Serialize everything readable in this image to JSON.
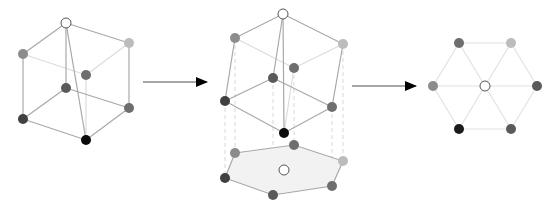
{
  "diagram": {
    "colors": {
      "edge": "#a8a8a8",
      "edge_back": "#dcdcdc",
      "projection_line": "#d8d8d8",
      "hex_fill": "#f2f2f2",
      "arrow": "#000000",
      "arrow_line": "#8a8a8a",
      "node_white": "#ffffff",
      "node_light": "#bcbcbc",
      "node_gray": "#8c8c8c",
      "node_mid": "#6e6e6e",
      "node_dark": "#404040",
      "node_black": "#0a0a0a"
    },
    "panels": [
      {
        "name": "cube-original",
        "nodes": [
          {
            "id": "top",
            "x": 66,
            "y": 23,
            "shade": "node_white"
          },
          {
            "id": "upper-left",
            "x": 23,
            "y": 54,
            "shade": "node_gray"
          },
          {
            "id": "upper-right",
            "x": 129,
            "y": 43,
            "shade": "node_light"
          },
          {
            "id": "back",
            "x": 86,
            "y": 75,
            "shade": "node_mid"
          },
          {
            "id": "inner",
            "x": 66,
            "y": 88,
            "shade": "node_mid"
          },
          {
            "id": "lower-left",
            "x": 23,
            "y": 119,
            "shade": "node_dark"
          },
          {
            "id": "lower-right",
            "x": 129,
            "y": 108,
            "shade": "node_mid"
          },
          {
            "id": "bottom",
            "x": 86,
            "y": 140,
            "shade": "node_black"
          }
        ]
      },
      {
        "name": "cube-rotated",
        "nodes": [
          {
            "id": "top",
            "x": 283,
            "y": 14,
            "shade": "node_white"
          },
          {
            "id": "upper-left",
            "x": 235,
            "y": 38,
            "shade": "node_gray"
          },
          {
            "id": "upper-right",
            "x": 343,
            "y": 44,
            "shade": "node_light"
          },
          {
            "id": "back",
            "x": 294,
            "y": 68,
            "shade": "node_mid"
          },
          {
            "id": "inner",
            "x": 273,
            "y": 78,
            "shade": "node_mid"
          },
          {
            "id": "lower-left",
            "x": 225,
            "y": 101,
            "shade": "node_dark"
          },
          {
            "id": "lower-right",
            "x": 332,
            "y": 107,
            "shade": "node_mid"
          },
          {
            "id": "bottom",
            "x": 284,
            "y": 133,
            "shade": "node_black"
          }
        ]
      },
      {
        "name": "projection-hexagon",
        "nodes": [
          {
            "id": "upper-left",
            "x": 235,
            "y": 153,
            "shade": "node_gray"
          },
          {
            "id": "back",
            "x": 294,
            "y": 145,
            "shade": "node_mid"
          },
          {
            "id": "upper-right",
            "x": 343,
            "y": 161,
            "shade": "node_light"
          },
          {
            "id": "lower-left",
            "x": 225,
            "y": 178,
            "shade": "node_dark"
          },
          {
            "id": "inner",
            "x": 273,
            "y": 195,
            "shade": "node_mid"
          },
          {
            "id": "lower-right",
            "x": 332,
            "y": 186,
            "shade": "node_mid"
          },
          {
            "id": "center",
            "x": 284,
            "y": 170,
            "shade": "node_white"
          }
        ]
      },
      {
        "name": "flat-hexagon",
        "nodes": [
          {
            "id": "top-left",
            "x": 459,
            "y": 43,
            "shade": "node_mid"
          },
          {
            "id": "top-right",
            "x": 511,
            "y": 43,
            "shade": "node_light"
          },
          {
            "id": "left",
            "x": 433,
            "y": 86,
            "shade": "node_gray"
          },
          {
            "id": "center",
            "x": 485,
            "y": 86,
            "shade": "node_white"
          },
          {
            "id": "right",
            "x": 537,
            "y": 86,
            "shade": "node_mid"
          },
          {
            "id": "bottom-left",
            "x": 459,
            "y": 129,
            "shade": "node_black"
          },
          {
            "id": "bottom-right",
            "x": 511,
            "y": 129,
            "shade": "node_mid"
          }
        ]
      }
    ],
    "arrows": [
      {
        "name": "arrow-cube-to-rotated",
        "x1": 143,
        "y1": 82,
        "x2": 207,
        "y2": 82
      },
      {
        "name": "arrow-rotated-to-flat",
        "x1": 352,
        "y1": 86,
        "x2": 416,
        "y2": 86
      }
    ]
  }
}
